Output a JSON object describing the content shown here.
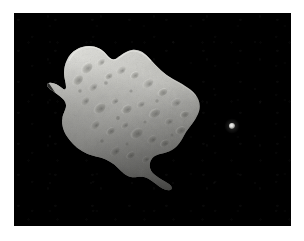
{
  "image": {
    "width": 304,
    "height": 241,
    "background_color": "#ffffff",
    "alt_text": "Asteroid 243 Ida with its small moon Dactyl against black space"
  },
  "photo": {
    "name": "asteroid-photograph",
    "left": 14,
    "top": 13,
    "width": 277,
    "height": 213,
    "sky_color": "#000000"
  },
  "subjects": {
    "asteroid": {
      "label": "asteroid",
      "center_x": 122,
      "center_y": 116,
      "length_px": 145,
      "width_px": 80,
      "orientation_degrees": 38,
      "surface_color": "#a8a8a4",
      "highlight_color": "#d8d8d4",
      "shadow_color": "#2c2c2a",
      "terminator_side": "lower-left"
    },
    "moon": {
      "label": "moon",
      "center_x": 232,
      "center_y": 126,
      "diameter_px": 6,
      "color": "#e8e8e4"
    }
  },
  "lighting": {
    "source_direction": "upper-left",
    "contrast": "high"
  },
  "palette": {
    "page_background": "#ffffff",
    "sky": "#000000",
    "regolith_bright": "#dcdcd8",
    "regolith_mid": "#a6a6a2",
    "regolith_dark": "#5a5a57",
    "limb_shadow": "#151514"
  }
}
